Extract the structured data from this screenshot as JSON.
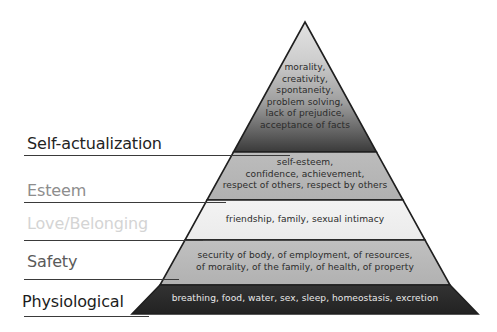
{
  "diagram": {
    "type": "pyramid",
    "tier_count": 5,
    "background_color": "#ffffff"
  },
  "tiers": [
    {
      "id": "self-actualization",
      "label": "Self-actualization",
      "label_color": "#232323",
      "fill_top": "#d7d7d7",
      "fill_bottom": "#3b3b3b",
      "text_color": "#2b2b2b",
      "body": "morality,\ncreativity,\nspontaneity,\nproblem solving,\nlack of prejudice,\nacceptance of facts",
      "items": [
        "morality",
        "creativity",
        "spontaneity",
        "problem solving",
        "lack of prejudice",
        "acceptance of facts"
      ]
    },
    {
      "id": "esteem",
      "label": "Esteem",
      "label_color": "#8d8d8d",
      "fill_top": "#b9b9b9",
      "fill_bottom": "#b2b2b2",
      "text_color": "#2b2b2b",
      "body": "self-esteem,\nconfidence, achievement,\nrespect of others, respect by others",
      "items": [
        "self-esteem",
        "confidence",
        "achievement",
        "respect of others",
        "respect by others"
      ]
    },
    {
      "id": "love-belonging",
      "label": "Love/Belonging",
      "label_color": "#d4d4d4",
      "fill_top": "#f1f1f1",
      "fill_bottom": "#ededed",
      "text_color": "#2b2b2b",
      "body": "friendship, family, sexual intimacy",
      "items": [
        "friendship",
        "family",
        "sexual intimacy"
      ]
    },
    {
      "id": "safety",
      "label": "Safety",
      "label_color": "#5a5a5a",
      "fill_top": "#bdbdbd",
      "fill_bottom": "#b4b4b4",
      "text_color": "#2b2b2b",
      "body": "security of body, of employment, of resources,\nof morality, of the family, of health, of property",
      "items": [
        "security of body",
        "of employment",
        "of resources",
        "of morality",
        "of the family",
        "of health",
        "of property"
      ]
    },
    {
      "id": "physiological",
      "label": "Physiological",
      "label_color": "#1c1c1c",
      "fill_top": "#2f2f2f",
      "fill_bottom": "#242424",
      "text_color": "#e9e9e9",
      "body": "breathing, food, water, sex, sleep, homeostasis, excretion",
      "items": [
        "breathing",
        "food",
        "water",
        "sex",
        "sleep",
        "homeostasis",
        "excretion"
      ]
    }
  ]
}
